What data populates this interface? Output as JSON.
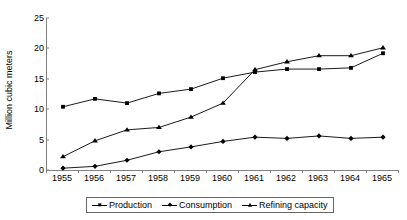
{
  "chart_data": {
    "type": "line",
    "title": "",
    "xlabel": "",
    "ylabel": "Million cubic meters",
    "categories": [
      "1955",
      "1956",
      "1957",
      "1958",
      "1959",
      "1960",
      "1961",
      "1962",
      "1963",
      "1964",
      "1965"
    ],
    "ylim": [
      0,
      25
    ],
    "yticks": [
      0,
      5,
      10,
      15,
      20,
      25
    ],
    "grid": false,
    "legend_position": "bottom",
    "series": [
      {
        "name": "Production",
        "marker": "square",
        "color": "#000000",
        "values": [
          10.4,
          11.7,
          11.0,
          12.6,
          13.3,
          15.1,
          16.1,
          16.6,
          16.6,
          16.8,
          19.2
        ]
      },
      {
        "name": "Consumption",
        "marker": "diamond",
        "color": "#000000",
        "values": [
          0.3,
          0.6,
          1.6,
          3.0,
          3.8,
          4.7,
          5.4,
          5.2,
          5.6,
          5.2,
          5.4
        ]
      },
      {
        "name": "Refining capacity",
        "marker": "triangle",
        "color": "#000000",
        "values": [
          2.2,
          4.8,
          6.6,
          7.0,
          8.7,
          11.0,
          16.5,
          17.8,
          18.8,
          18.8,
          20.1
        ]
      }
    ]
  },
  "axis": {
    "ytick_labels": [
      "0",
      "5",
      "10",
      "15",
      "20",
      "25"
    ],
    "xtick_labels": [
      "1955",
      "1956",
      "1957",
      "1958",
      "1959",
      "1960",
      "1961",
      "1962",
      "1963",
      "1964",
      "1965"
    ]
  },
  "legend": {
    "items": [
      {
        "label": "Production",
        "marker": "square"
      },
      {
        "label": "Consumption",
        "marker": "diamond"
      },
      {
        "label": "Refining capacity",
        "marker": "triangle"
      }
    ]
  }
}
